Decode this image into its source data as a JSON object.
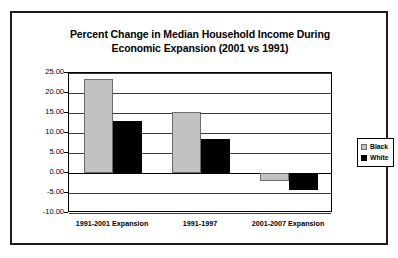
{
  "chart_data": {
    "type": "bar",
    "title": "Percent Change in Median Household Income During Economic Expansion (2001 vs 1991)",
    "title_line1": "Percent Change in Median Household Income During",
    "title_line2": "Economic Expansion (2001 vs 1991)",
    "xlabel": "",
    "ylabel": "",
    "categories": [
      "1991-2001 Expansion",
      "1991-1997",
      "2001-2007 Expansion"
    ],
    "series": [
      {
        "name": "Black",
        "color": "#c2c2c2",
        "values": [
          23.6,
          15.2,
          -2.1
        ]
      },
      {
        "name": "White",
        "color": "#000000",
        "values": [
          12.9,
          8.6,
          -4.3
        ]
      }
    ],
    "ylim": [
      -10.0,
      25.0
    ],
    "ytick_labels": [
      "25.00",
      "20.00",
      "15.00",
      "10.00",
      "5.00",
      "0.00",
      "-5.00",
      "-10.00"
    ],
    "ytick_values": [
      25.0,
      20.0,
      15.0,
      10.0,
      5.0,
      0.0,
      -5.0,
      -10.0
    ],
    "grid": true,
    "legend_position": "right"
  },
  "legend": {
    "entries": [
      {
        "label": "Black"
      },
      {
        "label": "White"
      }
    ]
  }
}
